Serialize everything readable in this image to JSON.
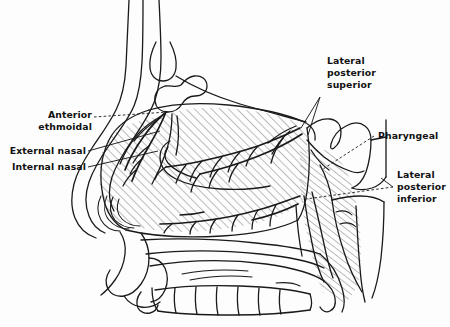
{
  "figure": {
    "kind": "anatomical-line-drawing",
    "view": "midsagittal / lateral profile, facing left",
    "shading": "diagonal line hatching over the nasal septum and nasopharynx",
    "background_color": "#fdfdfd",
    "ink_color": "#1a1a1a"
  },
  "labels": {
    "anterior_ethmoidal": "Anterior\nethmoidal",
    "anterior_ethmoidal_line1": "Anterior",
    "anterior_ethmoidal_line2": "ethmoidal",
    "external_nasal": "External nasal",
    "internal_nasal": "Internal nasal",
    "lateral_posterior_superior_line1": "Lateral",
    "lateral_posterior_superior_line2": "posterior",
    "lateral_posterior_superior_line3": "superior",
    "pharyngeal": "Pharyngeal",
    "lateral_posterior_inferior_line1": "Lateral",
    "lateral_posterior_inferior_line2": "posterior",
    "lateral_posterior_inferior_line3": "inferior"
  },
  "label_list": [
    {
      "name": "anterior-ethmoidal",
      "text": "Anterior ethmoidal",
      "side": "left",
      "leader": "dashed"
    },
    {
      "name": "external-nasal",
      "text": "External nasal",
      "side": "left",
      "leader": "solid"
    },
    {
      "name": "internal-nasal",
      "text": "Internal nasal",
      "side": "left",
      "leader": "solid"
    },
    {
      "name": "lateral-posterior-superior",
      "text": "Lateral posterior superior",
      "side": "right",
      "leader": "solid-forked"
    },
    {
      "name": "pharyngeal",
      "text": "Pharyngeal",
      "side": "right",
      "leader": "dashed"
    },
    {
      "name": "lateral-posterior-inferior",
      "text": "Lateral posterior inferior",
      "side": "right",
      "leader": "dashed"
    }
  ],
  "structures": [
    "forehead-and-nasal-bridge",
    "frontal-sinus",
    "ethmoid-air-cells",
    "nasal-tip",
    "columella",
    "nasal-septum-hatched",
    "sphenoid-sinus",
    "nasopharynx",
    "soft-palate",
    "hard-palate",
    "upper-teeth",
    "upper-lip"
  ]
}
